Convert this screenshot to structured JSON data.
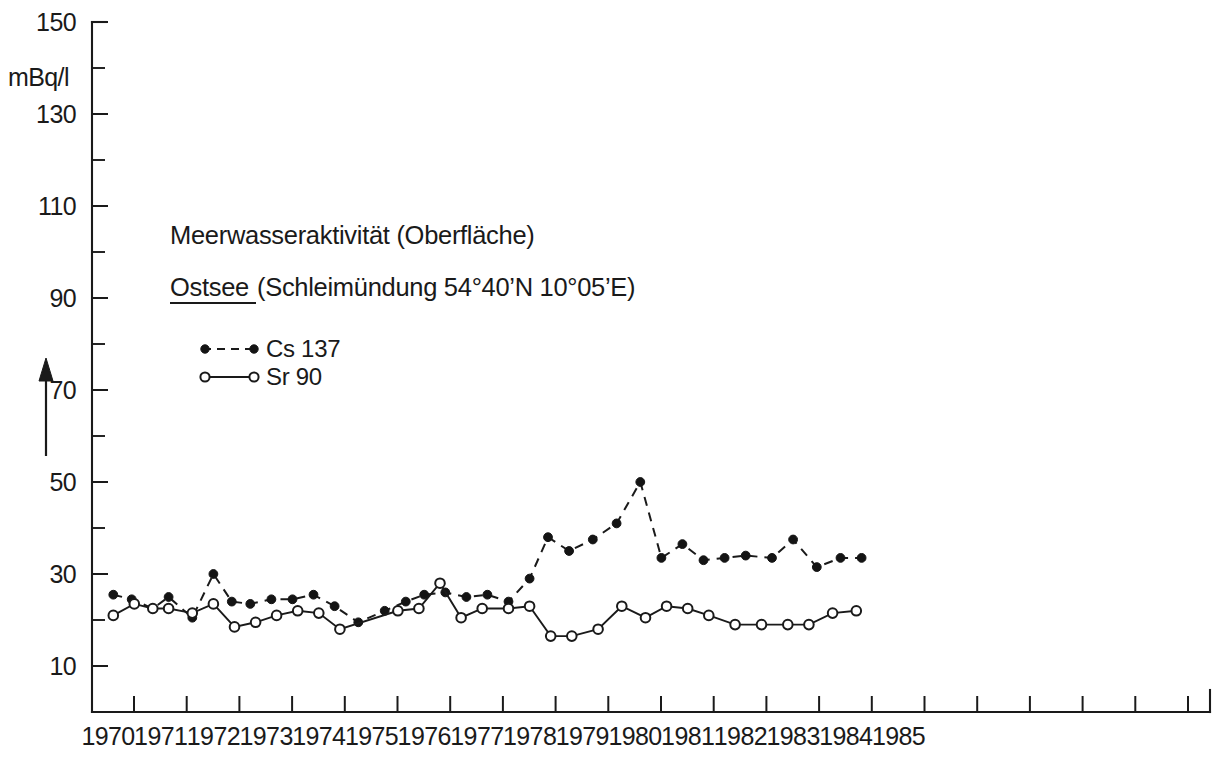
{
  "figure": {
    "title_line1": "Meerwasseraktivität (Oberfläche)",
    "title_line2_label": "Ostsee",
    "title_line2_rest": "(Schleimündung  54°40’N 10°05’E)",
    "y_axis_unit": "mBq/l",
    "ink_color": "#1a1a1a",
    "background_color": "#ffffff"
  },
  "legend": {
    "entries": [
      {
        "label": "Cs 137",
        "marker": "filled-circle",
        "line": "dashed"
      },
      {
        "label": "Sr 90",
        "marker": "open-circle",
        "line": "solid"
      }
    ]
  },
  "chart_data": {
    "type": "line",
    "xlabel": "",
    "ylabel": "mBq/l",
    "ylim": [
      0,
      150
    ],
    "xlim": [
      1970.0,
      1985.0
    ],
    "grid": false,
    "legend_position": "upper-left-inside",
    "y_ticks_major": [
      10,
      30,
      50,
      70,
      90,
      110,
      130,
      150
    ],
    "y_ticks_minor": [
      20,
      40,
      60,
      80,
      100,
      120,
      140
    ],
    "x_tick_labels": [
      "1970",
      "1971",
      "1972",
      "1973",
      "1974",
      "1975",
      "1976",
      "1977",
      "1978",
      "1979",
      "1980",
      "1981",
      "1982",
      "1983",
      "1984",
      "1985"
    ],
    "series": [
      {
        "name": "Cs 137",
        "marker": "filled-circle",
        "linestyle": "dashed",
        "x": [
          1970.1,
          1970.45,
          1970.85,
          1971.15,
          1971.6,
          1972.0,
          1972.35,
          1972.7,
          1973.1,
          1973.5,
          1973.9,
          1974.3,
          1974.75,
          1975.25,
          1975.65,
          1976.0,
          1976.4,
          1976.8,
          1977.2,
          1977.6,
          1978.0,
          1978.35,
          1978.75,
          1979.2,
          1979.65,
          1980.1,
          1980.5,
          1980.9,
          1981.3,
          1981.7,
          1982.1,
          1982.6,
          1983.0,
          1983.45,
          1983.9,
          1984.3
        ],
        "y": [
          25.5,
          24.5,
          22.5,
          25.0,
          20.5,
          30.0,
          24.0,
          23.5,
          24.5,
          24.5,
          25.5,
          23.0,
          19.5,
          22.0,
          24.0,
          25.5,
          26.0,
          25.0,
          25.5,
          24.0,
          29.0,
          38.0,
          35.0,
          37.5,
          41.0,
          50.0,
          33.5,
          36.5,
          33.0,
          33.5,
          34.0,
          33.5,
          37.5,
          31.5,
          33.5,
          33.5
        ]
      },
      {
        "name": "Sr 90",
        "marker": "open-circle",
        "linestyle": "solid",
        "x": [
          1970.1,
          1970.5,
          1970.85,
          1971.15,
          1971.6,
          1972.0,
          1972.4,
          1972.8,
          1973.2,
          1973.6,
          1974.0,
          1974.4,
          1975.5,
          1975.9,
          1976.3,
          1976.7,
          1977.1,
          1977.6,
          1978.0,
          1978.4,
          1978.8,
          1979.3,
          1979.75,
          1980.2,
          1980.6,
          1981.0,
          1981.4,
          1981.9,
          1982.4,
          1982.9,
          1983.3,
          1983.75,
          1984.2
        ],
        "y": [
          21.0,
          23.5,
          22.5,
          22.5,
          21.5,
          23.5,
          18.5,
          19.5,
          21.0,
          22.0,
          21.5,
          18.0,
          22.0,
          22.5,
          28.0,
          20.5,
          22.5,
          22.5,
          23.0,
          16.5,
          16.5,
          18.0,
          23.0,
          20.5,
          23.0,
          22.5,
          21.0,
          19.0,
          19.0,
          19.0,
          19.0,
          21.5,
          22.0
        ]
      }
    ]
  }
}
